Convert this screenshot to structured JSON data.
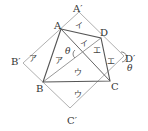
{
  "diagram": {
    "type": "geometry-figure",
    "points": {
      "A": {
        "label": "A",
        "x": 61,
        "y": 29
      },
      "B": {
        "label": "B",
        "x": 43,
        "y": 82
      },
      "C": {
        "label": "C",
        "x": 110,
        "y": 81
      },
      "D": {
        "label": "D",
        "x": 101,
        "y": 38
      },
      "A_prime": {
        "label": "A′",
        "x": 79,
        "y": 12
      },
      "B_prime": {
        "label": "B′",
        "x": 23,
        "y": 63
      },
      "C_prime": {
        "label": "C′",
        "x": 70,
        "y": 108
      },
      "D_prime": {
        "label": "D′",
        "x": 124,
        "y": 56
      }
    },
    "region_labels": {
      "i_top": "イ",
      "i_inner": "イ",
      "a_outer": "ア",
      "a_inner": "ア",
      "e_inner": "エ",
      "e_outer": "エ",
      "u_inner": "ウ",
      "u_outer": "ウ"
    },
    "angles": {
      "theta_center": "θ",
      "theta_dprime": "θ"
    },
    "colors": {
      "inner_quad": "#555555",
      "outer_square": "#aaaaaa",
      "label": "#333333"
    }
  }
}
